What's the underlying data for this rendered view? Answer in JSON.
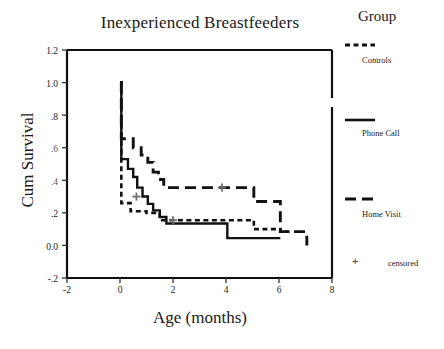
{
  "chart_data": {
    "type": "line",
    "title": "Inexperienced Breastfeeders",
    "xlabel": "Age (months)",
    "ylabel": "Cum Survival",
    "xlim": [
      -2,
      8
    ],
    "ylim": [
      -0.2,
      1.2
    ],
    "grid": false,
    "xticks": [
      "-2",
      "0",
      "2",
      "4",
      "6",
      "8"
    ],
    "xtick_values": [
      -2,
      0,
      2,
      4,
      6,
      8
    ],
    "yticks": [
      "1.2",
      "1.0",
      ".8",
      ".6",
      ".4",
      ".2",
      "0.0",
      "-.2"
    ],
    "ytick_values": [
      1.2,
      1.0,
      0.8,
      0.6,
      0.4,
      0.2,
      0.0,
      -0.2
    ],
    "legend_title": "Group",
    "legend_position": "right",
    "series": [
      {
        "name": "Controls",
        "style": "dotted",
        "points": [
          [
            0.0,
            1.0
          ],
          [
            0.05,
            0.26
          ],
          [
            0.35,
            0.26
          ],
          [
            0.4,
            0.21
          ],
          [
            0.95,
            0.21
          ],
          [
            1.0,
            0.2
          ],
          [
            1.45,
            0.2
          ],
          [
            1.5,
            0.155
          ],
          [
            5.0,
            0.155
          ],
          [
            5.05,
            0.1
          ],
          [
            6.0,
            0.1
          ],
          [
            6.05,
            0.085
          ],
          [
            6.4,
            0.085
          ]
        ],
        "censored": [
          [
            2.0,
            0.155
          ]
        ]
      },
      {
        "name": "Phone Call",
        "style": "solid",
        "points": [
          [
            0.0,
            1.0
          ],
          [
            0.05,
            0.53
          ],
          [
            0.25,
            0.53
          ],
          [
            0.3,
            0.47
          ],
          [
            0.45,
            0.47
          ],
          [
            0.5,
            0.42
          ],
          [
            0.6,
            0.42
          ],
          [
            0.65,
            0.355
          ],
          [
            0.8,
            0.355
          ],
          [
            0.85,
            0.3
          ],
          [
            1.0,
            0.3
          ],
          [
            1.05,
            0.255
          ],
          [
            1.2,
            0.255
          ],
          [
            1.25,
            0.215
          ],
          [
            1.45,
            0.215
          ],
          [
            1.5,
            0.175
          ],
          [
            1.7,
            0.175
          ],
          [
            1.75,
            0.135
          ],
          [
            3.9,
            0.135
          ],
          [
            3.95,
            0.135
          ],
          [
            4.0,
            0.135
          ],
          [
            4.05,
            0.045
          ],
          [
            6.0,
            0.045
          ],
          [
            6.05,
            0.045
          ]
        ],
        "censored": [
          [
            0.62,
            0.3
          ]
        ]
      },
      {
        "name": "Home Visit",
        "style": "dashed",
        "points": [
          [
            0.0,
            1.0
          ],
          [
            0.05,
            0.655
          ],
          [
            0.45,
            0.655
          ],
          [
            0.5,
            0.6
          ],
          [
            0.75,
            0.6
          ],
          [
            0.8,
            0.555
          ],
          [
            1.0,
            0.555
          ],
          [
            1.05,
            0.51
          ],
          [
            1.2,
            0.51
          ],
          [
            1.25,
            0.45
          ],
          [
            1.4,
            0.45
          ],
          [
            1.45,
            0.405
          ],
          [
            1.6,
            0.405
          ],
          [
            1.65,
            0.355
          ],
          [
            5.0,
            0.355
          ],
          [
            5.05,
            0.27
          ],
          [
            6.0,
            0.27
          ],
          [
            6.05,
            0.085
          ],
          [
            7.0,
            0.085
          ],
          [
            7.05,
            0.0
          ]
        ],
        "censored": [
          [
            3.85,
            0.355
          ]
        ]
      }
    ],
    "censored_label": "censored",
    "censored_marker": "+"
  },
  "legend": {
    "title": "Group",
    "entries": [
      {
        "label": "Controls",
        "style": "dotted"
      },
      {
        "label": "Phone Call",
        "style": "solid"
      },
      {
        "label": "Home Visit",
        "style": "dashed"
      }
    ],
    "censored": {
      "marker": "+",
      "label": "censored"
    }
  },
  "axes": {
    "x_tick_labels": [
      "-2",
      "0",
      "2",
      "4",
      "6",
      "8"
    ],
    "y_tick_labels": [
      "1.2",
      "1.0",
      ".8",
      ".6",
      ".4",
      ".2",
      "0.0",
      "-.2"
    ]
  }
}
